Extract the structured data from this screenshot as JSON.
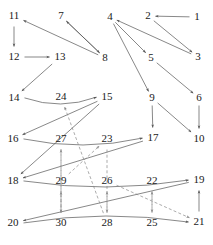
{
  "diagram": {
    "type": "directed-graph",
    "title": "",
    "background_color": "#ffffff",
    "solid_edge_color": "#555555",
    "dashed_edge_color": "#888888",
    "label_color": "#1a1a1a",
    "node_count": 30,
    "nodes": [
      {
        "id": "1",
        "label": "1",
        "x": 197,
        "y": 17
      },
      {
        "id": "2",
        "label": "2",
        "x": 148,
        "y": 16
      },
      {
        "id": "3",
        "label": "3",
        "x": 198,
        "y": 57
      },
      {
        "id": "4",
        "label": "4",
        "x": 110,
        "y": 17
      },
      {
        "id": "5",
        "label": "5",
        "x": 151,
        "y": 58
      },
      {
        "id": "6",
        "label": "6",
        "x": 199,
        "y": 98
      },
      {
        "id": "7",
        "label": "7",
        "x": 61,
        "y": 16
      },
      {
        "id": "8",
        "label": "8",
        "x": 105,
        "y": 58
      },
      {
        "id": "9",
        "label": "9",
        "x": 152,
        "y": 98
      },
      {
        "id": "10",
        "label": "10",
        "x": 199,
        "y": 139
      },
      {
        "id": "11",
        "label": "11",
        "x": 14,
        "y": 16
      },
      {
        "id": "12",
        "label": "12",
        "x": 14,
        "y": 57
      },
      {
        "id": "13",
        "label": "13",
        "x": 60,
        "y": 57
      },
      {
        "id": "14",
        "label": "14",
        "x": 14,
        "y": 98
      },
      {
        "id": "15",
        "label": "15",
        "x": 107,
        "y": 97
      },
      {
        "id": "16",
        "label": "16",
        "x": 13,
        "y": 139
      },
      {
        "id": "17",
        "label": "17",
        "x": 153,
        "y": 138
      },
      {
        "id": "18",
        "label": "18",
        "x": 13,
        "y": 181
      },
      {
        "id": "19",
        "label": "19",
        "x": 199,
        "y": 180
      },
      {
        "id": "20",
        "label": "20",
        "x": 13,
        "y": 223
      },
      {
        "id": "21",
        "label": "21",
        "x": 199,
        "y": 222
      },
      {
        "id": "22",
        "label": "22",
        "x": 152,
        "y": 181
      },
      {
        "id": "23",
        "label": "23",
        "x": 107,
        "y": 139
      },
      {
        "id": "24",
        "label": "24",
        "x": 61,
        "y": 97
      },
      {
        "id": "25",
        "label": "25",
        "x": 152,
        "y": 223
      },
      {
        "id": "26",
        "label": "26",
        "x": 107,
        "y": 181
      },
      {
        "id": "27",
        "label": "27",
        "x": 61,
        "y": 139
      },
      {
        "id": "28",
        "label": "28",
        "x": 107,
        "y": 223
      },
      {
        "id": "29",
        "label": "29",
        "x": 61,
        "y": 181
      },
      {
        "id": "30",
        "label": "30",
        "x": 61,
        "y": 223
      }
    ],
    "edges_solid": [
      {
        "from": "1",
        "to": "2",
        "style": "straight"
      },
      {
        "from": "2",
        "to": "3",
        "style": "straight"
      },
      {
        "from": "3",
        "to": "4",
        "style": "straight"
      },
      {
        "from": "4",
        "to": "5",
        "style": "straight"
      },
      {
        "from": "5",
        "to": "6",
        "style": "straight"
      },
      {
        "from": "6",
        "to": "10",
        "style": "straight"
      },
      {
        "from": "7",
        "to": "8",
        "style": "straight"
      },
      {
        "from": "8",
        "to": "7",
        "style": "straight"
      },
      {
        "from": "4",
        "to": "9",
        "style": "straight"
      },
      {
        "from": "9",
        "to": "10",
        "style": "straight"
      },
      {
        "from": "11",
        "to": "12",
        "style": "straight"
      },
      {
        "from": "12",
        "to": "13",
        "style": "straight"
      },
      {
        "from": "8",
        "to": "11",
        "style": "straight"
      },
      {
        "from": "13",
        "to": "14",
        "style": "straight"
      },
      {
        "from": "14",
        "to": "15",
        "style": "curve-up"
      },
      {
        "from": "15",
        "to": "16",
        "style": "straight"
      },
      {
        "from": "16",
        "to": "17",
        "style": "curve-up"
      },
      {
        "from": "9",
        "to": "17",
        "style": "straight"
      },
      {
        "from": "17",
        "to": "18",
        "style": "straight"
      },
      {
        "from": "18",
        "to": "19",
        "style": "curve-up"
      },
      {
        "from": "19",
        "to": "20",
        "style": "straight"
      },
      {
        "from": "20",
        "to": "21",
        "style": "curve-down"
      },
      {
        "from": "15",
        "to": "18",
        "style": "straight"
      },
      {
        "from": "21",
        "to": "19",
        "style": "straight"
      }
    ],
    "edges_dashed": [
      {
        "from": "28",
        "to": "24",
        "style": "straight"
      },
      {
        "from": "30",
        "to": "27",
        "style": "straight"
      },
      {
        "from": "30",
        "to": "29",
        "style": "straight"
      },
      {
        "from": "29",
        "to": "23",
        "style": "straight"
      },
      {
        "from": "28",
        "to": "26",
        "style": "straight"
      },
      {
        "from": "25",
        "to": "22",
        "style": "straight"
      },
      {
        "from": "23",
        "to": "28",
        "style": "straight"
      },
      {
        "from": "22",
        "to": "25",
        "style": "straight"
      },
      {
        "from": "26",
        "to": "21",
        "style": "straight"
      },
      {
        "from": "27",
        "to": "30",
        "style": "straight"
      }
    ]
  }
}
